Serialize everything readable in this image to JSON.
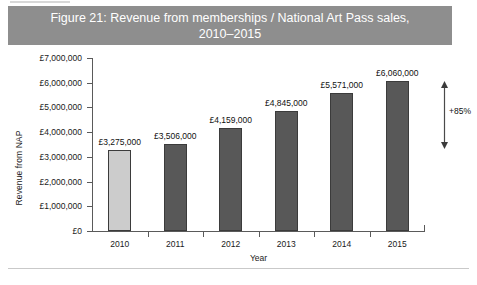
{
  "figure": {
    "title_line1": "Figure 21: Revenue from memberships / National Art Pass sales,",
    "title_line2": "2010–2015",
    "banner_color": "#8e8e8e",
    "banner_text_color": "#ffffff"
  },
  "chart_data": {
    "type": "bar",
    "title": "Figure 21: Revenue from memberships / National Art Pass sales, 2010–2015",
    "categories": [
      "2010",
      "2011",
      "2012",
      "2013",
      "2014",
      "2015"
    ],
    "values": [
      3275000,
      3506000,
      4159000,
      4845000,
      5571000,
      6060000
    ],
    "value_labels": [
      "£3,275,000",
      "£3,506,000",
      "£4,159,000",
      "£4,845,000",
      "£5,571,000",
      "£6,060,000"
    ],
    "bar_colors": [
      "#cccccc",
      "#585858",
      "#585858",
      "#585858",
      "#585858",
      "#585858"
    ],
    "xlabel": "Year",
    "ylabel": "Revenue from NAP",
    "ylim": [
      0,
      7000000
    ],
    "ytick_values": [
      0,
      1000000,
      2000000,
      3000000,
      4000000,
      5000000,
      6000000,
      7000000
    ],
    "ytick_labels": [
      "£0",
      "£1,000,000",
      "£2,000,000",
      "£3,000,000",
      "£4,000,000",
      "£5,000,000",
      "£6,000,000",
      "£7,000,000"
    ],
    "grid": false,
    "legend": null,
    "annotations": [
      {
        "text": "+85%",
        "type": "double-headed-vertical-arrow",
        "describes": "growth from 2010 to 2015"
      }
    ]
  }
}
